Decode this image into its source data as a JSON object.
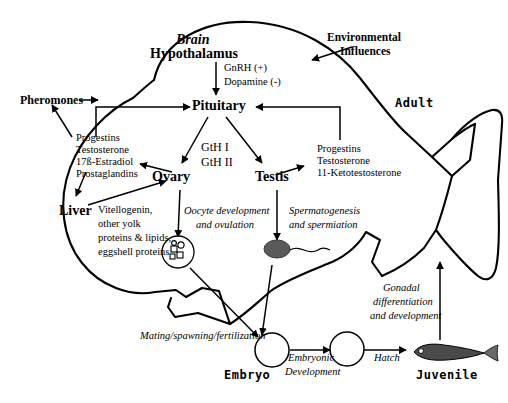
{
  "diagram": {
    "labels": {
      "brain": "Brain",
      "hypothalamus": "Hypothalamus",
      "gnrh": "GnRH (+)",
      "dopamine": "Dopamine (-)",
      "pituitary": "Pituitary",
      "environmental_influences_1": "Environmental",
      "environmental_influences_2": "Influences",
      "adult": "Adult",
      "pheromones": "Pheromones",
      "gth1": "GtH I",
      "gth2": "GtH II",
      "ovary": "Ovary",
      "testis": "Testis",
      "liver": "Liver",
      "female_steroids": [
        "Progestins",
        "Testosterone",
        "17ß-Estradiol",
        "Prostaglandins"
      ],
      "male_steroids": [
        "Progestins",
        "Testosterone",
        "11-Ketotestosterone"
      ],
      "liver_products": [
        "Vitellogenin,",
        "other yolk",
        "proteins & lipids,",
        "eggshell proteins"
      ],
      "oocyte_dev_1": "Oocyte development",
      "oocyte_dev_2": "and  ovulation",
      "spermatogenesis_1": "Spermatogenesis",
      "spermatogenesis_2": "and spermiation",
      "mating": "Mating/spawning/fertilization",
      "embryo": "Embryo",
      "embryonic_dev_1": "Embryonic",
      "embryonic_dev_2": "Development",
      "hatch": "Hatch",
      "juvenile": "Juvenile",
      "gonadal_1": "Gonadal",
      "gonadal_2": "differentiation",
      "gonadal_3": "and development"
    },
    "colors": {
      "line": "#000000",
      "background": "#ffffff",
      "sperm_head": "#5a5a5a"
    }
  }
}
